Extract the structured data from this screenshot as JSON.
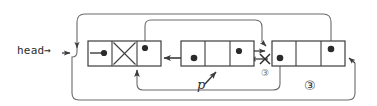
{
  "diagram": {
    "stroke_color": "#4a4a4a",
    "node_stroke_color": "#3c3c3c",
    "text_color": "#2b2b2b",
    "background": "#ffffff",
    "labels": {
      "head": "head→",
      "pointer_p": "p",
      "step_marker_small": "③",
      "step_marker_large": "③"
    },
    "nodes": [
      {
        "id": "node-1",
        "x": 88,
        "y": 41,
        "width": 73,
        "height": 25,
        "cells": [
          {
            "id": "node-1-cell-1",
            "content": "dot"
          },
          {
            "id": "node-1-cell-2",
            "content": "cross"
          },
          {
            "id": "node-1-cell-3",
            "content": "dot"
          }
        ]
      },
      {
        "id": "node-2",
        "x": 181,
        "y": 41,
        "width": 73,
        "height": 25,
        "cells": [
          {
            "id": "node-2-cell-1",
            "content": "dot"
          },
          {
            "id": "node-2-cell-2",
            "content": "empty"
          },
          {
            "id": "node-2-cell-3",
            "content": "dot"
          }
        ]
      },
      {
        "id": "node-3",
        "x": 272,
        "y": 41,
        "width": 73,
        "height": 25,
        "cells": [
          {
            "id": "node-3-cell-1",
            "content": "dot"
          },
          {
            "id": "node-3-cell-2",
            "content": "empty"
          },
          {
            "id": "node-3-cell-3",
            "content": "dot"
          }
        ]
      }
    ],
    "edges": [
      {
        "id": "edge-head-to-node1",
        "from": "head",
        "to": "node-1",
        "style": "arrow"
      },
      {
        "id": "edge-node1-cell3-up-loop",
        "from": "node-1-cell-3",
        "to": "node-3-left",
        "style": "arrow-over-top"
      },
      {
        "id": "edge-node2-cell3-to-node3",
        "from": "node-2-cell-3",
        "to": "node-3-left",
        "style": "arrow"
      },
      {
        "id": "edge-node3-to-node2",
        "from": "node-3-left",
        "to": "node-2-right",
        "style": "arrow-crossed-out"
      },
      {
        "id": "edge-node2-cell1-to-node1",
        "from": "node-2-cell-1",
        "to": "node-1-right",
        "style": "arrow"
      },
      {
        "id": "edge-node3-cell1-down-to-node1",
        "from": "node-3-cell-1",
        "to": "node-1-bottom",
        "style": "arrow-under"
      },
      {
        "id": "edge-node3-cell3-over-top-to-node1",
        "from": "node-3-cell-3",
        "to": "node-1-left",
        "style": "arrow-over-outer-top"
      },
      {
        "id": "edge-outer-bottom-to-node3-right",
        "from": "node-1-bottom-left",
        "to": "node-3-right",
        "style": "arrow-under-outer"
      }
    ]
  }
}
